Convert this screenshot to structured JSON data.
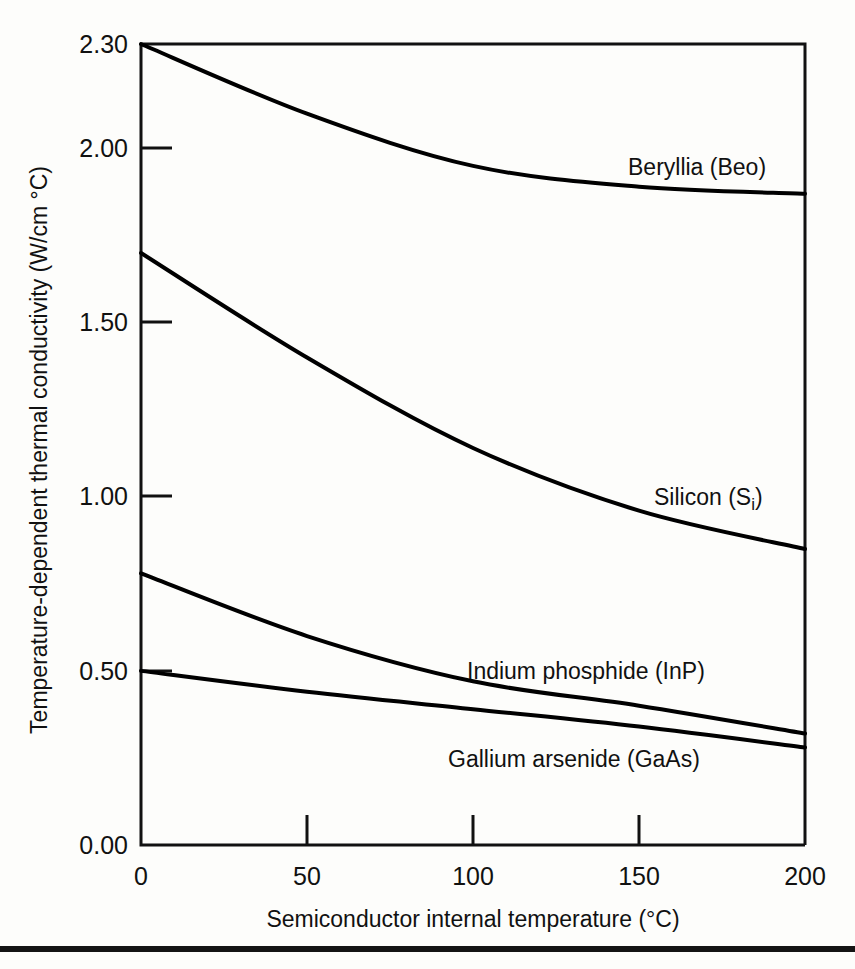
{
  "chart_data": {
    "type": "line",
    "title": "",
    "subtitle": "",
    "xlabel": "Semiconductor internal temperature (°C)",
    "ylabel": "Temperature-dependent thermal conductivity (W/cm °C)",
    "xlim": [
      0,
      200
    ],
    "ylim": [
      0.0,
      2.3
    ],
    "grid": false,
    "legend_position": "inline-curve-labels",
    "x": [
      0,
      50,
      100,
      150,
      200
    ],
    "xticks": [
      "0",
      "50",
      "100",
      "150",
      "200"
    ],
    "yticks": [
      "0.00",
      "0.50",
      "1.00",
      "1.50",
      "2.00",
      "2.30"
    ],
    "ytick_values": [
      0.0,
      0.5,
      1.0,
      1.5,
      2.0,
      2.3
    ],
    "series": [
      {
        "name": "Beryllia (Beo)",
        "label": "Beryllia (Beo)",
        "values": [
          2.3,
          2.1,
          1.95,
          1.89,
          1.87
        ]
      },
      {
        "name": "Silicon (Si)",
        "label": "Silicon (S",
        "label_sub": "i",
        "label_tail": ")",
        "values": [
          1.7,
          1.4,
          1.14,
          0.96,
          0.85
        ]
      },
      {
        "name": "Indium phosphide (InP)",
        "label": "Indium phosphide (InP)",
        "values": [
          0.78,
          0.6,
          0.47,
          0.4,
          0.32
        ]
      },
      {
        "name": "Gallium arsenide (GaAs)",
        "label": "Gallium arsenide (GaAs)",
        "values": [
          0.5,
          0.44,
          0.39,
          0.34,
          0.28
        ]
      }
    ]
  },
  "axes": {
    "y_title": "Temperature-dependent thermal conductivity (W/cm °C)",
    "x_title": "Semiconductor internal temperature (°C)",
    "y_tick_labels": [
      "2.30",
      "2.00",
      "1.50",
      "1.00",
      "0.50",
      "0.00"
    ],
    "x_tick_labels": [
      "0",
      "50",
      "100",
      "150",
      "200"
    ]
  },
  "series_labels": {
    "beryllia": "Beryllia (Beo)",
    "silicon_main": "Silicon (S",
    "silicon_sub": "i",
    "silicon_close": ")",
    "indium_phosphide": "Indium phosphide (InP)",
    "gallium_arsenide": "Gallium arsenide (GaAs)"
  },
  "colors": {
    "curve": "#000000",
    "axis": "#111111",
    "background": "#fdfdfb",
    "rule": "#141414"
  }
}
